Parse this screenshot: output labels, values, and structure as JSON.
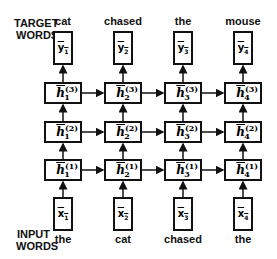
{
  "labels": {
    "target_line1": "TARGET",
    "target_line2": "WORDS",
    "input_line1": "INPUT",
    "input_line2": "WORDS"
  },
  "columns": [
    {
      "target": "cat",
      "input": "the",
      "y_sym": "y",
      "y_sub": "1",
      "x_sym": "x",
      "x_sub": "1",
      "h_sub": "1"
    },
    {
      "target": "chased",
      "input": "cat",
      "y_sym": "y",
      "y_sub": "2",
      "x_sym": "x",
      "x_sub": "2",
      "h_sub": "2"
    },
    {
      "target": "the",
      "input": "chased",
      "y_sym": "y",
      "y_sub": "3",
      "x_sym": "x",
      "x_sub": "3",
      "h_sub": "3"
    },
    {
      "target": "mouse",
      "input": "the",
      "y_sym": "y",
      "y_sub": "4",
      "x_sym": "x",
      "x_sub": "4",
      "h_sub": "4"
    }
  ],
  "layers": [
    {
      "sup": "(3)"
    },
    {
      "sup": "(2)"
    },
    {
      "sup": "(1)"
    }
  ],
  "h_sym": "h",
  "colors": {
    "stroke": "#111111",
    "background": "#ffffff"
  }
}
